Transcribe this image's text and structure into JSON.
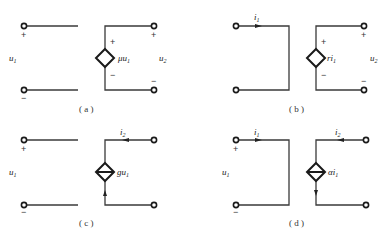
{
  "figure": {
    "panels": [
      {
        "id": "a",
        "caption": "( a )",
        "input_voltage": {
          "symbol": "u",
          "sub": "1"
        },
        "output_voltage": {
          "symbol": "u",
          "sub": "2"
        },
        "source_type": "dependent-voltage-source",
        "source_label": {
          "prefix": "μu",
          "sub": "1"
        },
        "source_plus": "+",
        "source_minus": "−",
        "in_plus": "+",
        "in_minus": "−",
        "out_plus": "+",
        "out_minus": "−"
      },
      {
        "id": "b",
        "caption": "( b )",
        "input_current": {
          "symbol": "i",
          "sub": "1"
        },
        "output_voltage": {
          "symbol": "u",
          "sub": "2"
        },
        "source_type": "dependent-voltage-source",
        "source_label": {
          "prefix": "ri",
          "sub": "1"
        },
        "source_plus": "+",
        "source_minus": "−",
        "out_plus": "+",
        "out_minus": "−"
      },
      {
        "id": "c",
        "caption": "( c )",
        "input_voltage": {
          "symbol": "u",
          "sub": "1"
        },
        "output_current": {
          "symbol": "i",
          "sub": "2"
        },
        "source_type": "dependent-current-source",
        "source_label": {
          "prefix": "gu",
          "sub": "1"
        },
        "in_plus": "+",
        "in_minus": "−"
      },
      {
        "id": "d",
        "caption": "( d )",
        "input_voltage": {
          "symbol": "u",
          "sub": "1"
        },
        "input_current": {
          "symbol": "i",
          "sub": "1"
        },
        "output_current": {
          "symbol": "i",
          "sub": "2"
        },
        "source_type": "dependent-current-source",
        "source_label": {
          "prefix": "αi",
          "sub": "1"
        },
        "in_plus": "+",
        "in_minus": "−"
      }
    ]
  }
}
